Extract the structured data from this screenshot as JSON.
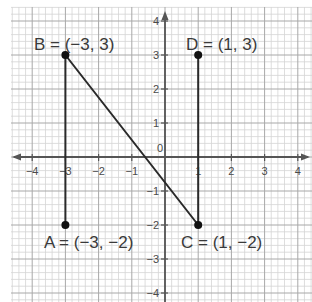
{
  "diagram": {
    "type": "coordinate-plane",
    "x_range": [
      -4,
      4
    ],
    "y_range": [
      -4,
      4
    ],
    "grid": {
      "major_step": 1,
      "minor_divisions": 5
    },
    "x_ticks": [
      "−4",
      "−3",
      "−2",
      "−1",
      "1",
      "2",
      "3",
      "4"
    ],
    "y_ticks": [
      "4",
      "3",
      "2",
      "1",
      "−1",
      "−2",
      "−3",
      "−4"
    ],
    "origin_label": "0",
    "points": [
      {
        "name": "A",
        "x": -3,
        "y": -2,
        "label": "A = (−3, −2)"
      },
      {
        "name": "B",
        "x": -3,
        "y": 3,
        "label": "B = (−3, 3)"
      },
      {
        "name": "C",
        "x": 1,
        "y": -2,
        "label": "C = (1, −2)"
      },
      {
        "name": "D",
        "x": 1,
        "y": 3,
        "label": "D = (1, 3)"
      }
    ],
    "segments": [
      {
        "from": "A",
        "to": "B"
      },
      {
        "from": "B",
        "to": "C"
      },
      {
        "from": "C",
        "to": "D"
      }
    ],
    "colors": {
      "grid_minor": "#d4d4d4",
      "grid_major": "#a8a8a8",
      "axis": "#555555",
      "segment": "#2a2a2a",
      "point": "#111111"
    }
  }
}
